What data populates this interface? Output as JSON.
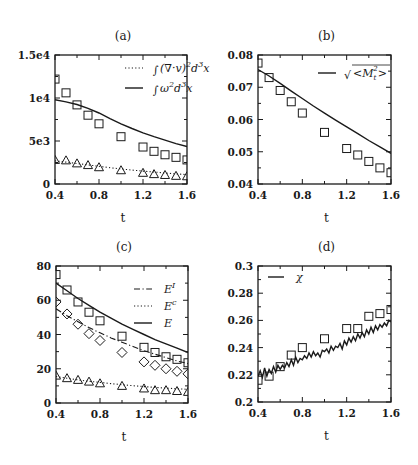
{
  "figure": {
    "width": 418,
    "height": 465,
    "background": "#ffffff",
    "ink": "#1a1a1a"
  },
  "chart_data": [
    {
      "id": "a",
      "type": "line",
      "title": "(a)",
      "xlabel": "t",
      "ylabel": "",
      "xlim": [
        0.4,
        1.6
      ],
      "ylim": [
        0,
        15000
      ],
      "xticks": [
        0.4,
        0.8,
        1.2,
        1.6
      ],
      "xtick_labels": [
        "0.4",
        "0.8",
        "1.2",
        "1.6"
      ],
      "yticks": [
        0,
        5000,
        10000,
        15000
      ],
      "ytick_labels": [
        "0",
        "5e3",
        "1e4",
        "1.5e4"
      ],
      "minor_xticks": [
        0.6,
        1.0,
        1.4
      ],
      "minor_yticks": [
        2500,
        7500,
        12500
      ],
      "frame": {
        "left": 55,
        "top": 55,
        "right": 187,
        "bottom": 184
      },
      "legend_position": "upper right",
      "grid": false,
      "series": [
        {
          "name": "∫(∇·v)² d³x",
          "style": "dotted",
          "x": [
            0.4,
            0.5,
            0.6,
            0.7,
            0.8,
            0.9,
            1.0,
            1.1,
            1.2,
            1.3,
            1.4,
            1.5,
            1.6
          ],
          "values": [
            2700,
            2550,
            2380,
            2220,
            2060,
            1900,
            1750,
            1620,
            1500,
            1390,
            1280,
            1180,
            1090
          ]
        },
        {
          "name": "∫ω² d³x",
          "style": "solid",
          "x": [
            0.4,
            0.5,
            0.6,
            0.7,
            0.8,
            0.9,
            1.0,
            1.1,
            1.2,
            1.3,
            1.4,
            1.5,
            1.6
          ],
          "values": [
            9800,
            9550,
            9250,
            8800,
            8250,
            7600,
            7000,
            6450,
            5950,
            5500,
            5100,
            4700,
            4350
          ]
        },
        {
          "name": "squares (∫ω² d³x data)",
          "style": "marker",
          "marker": "square",
          "x": [
            0.4,
            0.5,
            0.6,
            0.7,
            0.8,
            1.0,
            1.2,
            1.3,
            1.4,
            1.5,
            1.6
          ],
          "values": [
            12200,
            10600,
            9200,
            8000,
            7000,
            5500,
            4300,
            3800,
            3400,
            3100,
            2800
          ]
        },
        {
          "name": "triangles (∫(∇·v)² d³x data)",
          "style": "marker",
          "marker": "triangle",
          "x": [
            0.4,
            0.5,
            0.6,
            0.7,
            0.8,
            1.0,
            1.2,
            1.3,
            1.4,
            1.5,
            1.6
          ],
          "values": [
            2800,
            2750,
            2400,
            2200,
            1950,
            1600,
            1300,
            1150,
            1050,
            950,
            900
          ]
        }
      ],
      "legend": [
        {
          "label": "∫(∇·v)²d³x",
          "style": "dotted"
        },
        {
          "label": "∫ω²d³x",
          "style": "solid"
        }
      ]
    },
    {
      "id": "b",
      "type": "line",
      "title": "(b)",
      "xlabel": "t",
      "ylabel": "",
      "xlim": [
        0.4,
        1.6
      ],
      "ylim": [
        0.04,
        0.08
      ],
      "xticks": [
        0.4,
        0.8,
        1.2,
        1.6
      ],
      "xtick_labels": [
        "0.4",
        "0.8",
        "1.2",
        "1.6"
      ],
      "yticks": [
        0.04,
        0.05,
        0.06,
        0.07,
        0.08
      ],
      "ytick_labels": [
        "0.04",
        "0.05",
        "0.06",
        "0.07",
        "0.08"
      ],
      "minor_xticks": [
        0.6,
        1.0,
        1.4
      ],
      "minor_yticks": [
        0.045,
        0.055,
        0.065,
        0.075
      ],
      "frame": {
        "left": 258,
        "top": 55,
        "right": 391,
        "bottom": 184
      },
      "legend_position": "upper right",
      "grid": false,
      "series": [
        {
          "name": "√<M_t²>",
          "style": "solid",
          "x": [
            0.4,
            0.5,
            0.6,
            0.7,
            0.8,
            0.9,
            1.0,
            1.1,
            1.2,
            1.3,
            1.4,
            1.5,
            1.6
          ],
          "values": [
            0.0755,
            0.0735,
            0.0712,
            0.0688,
            0.0665,
            0.0642,
            0.062,
            0.0598,
            0.0577,
            0.0556,
            0.0535,
            0.0515,
            0.0495
          ]
        },
        {
          "name": "squares (data)",
          "style": "marker",
          "marker": "square",
          "x": [
            0.4,
            0.5,
            0.6,
            0.7,
            0.8,
            1.0,
            1.2,
            1.3,
            1.4,
            1.5,
            1.6
          ],
          "values": [
            0.0775,
            0.073,
            0.069,
            0.0655,
            0.062,
            0.056,
            0.051,
            0.049,
            0.047,
            0.045,
            0.0435
          ]
        }
      ],
      "legend": [
        {
          "label": "√<M_t²>",
          "style": "solid"
        }
      ]
    },
    {
      "id": "c",
      "type": "line",
      "title": "(c)",
      "xlabel": "t",
      "ylabel": "",
      "xlim": [
        0.4,
        1.6
      ],
      "ylim": [
        0,
        80
      ],
      "xticks": [
        0.4,
        0.8,
        1.2,
        1.6
      ],
      "xtick_labels": [
        "0.4",
        "0.8",
        "1.2",
        "1.6"
      ],
      "yticks": [
        0,
        20,
        40,
        60,
        80
      ],
      "ytick_labels": [
        "0",
        "20",
        "40",
        "60",
        "80"
      ],
      "minor_xticks": [
        0.6,
        1.0,
        1.4
      ],
      "minor_yticks": [
        10,
        30,
        50,
        70
      ],
      "frame": {
        "left": 56,
        "top": 266,
        "right": 188,
        "bottom": 403
      },
      "legend_position": "upper right",
      "grid": false,
      "series": [
        {
          "name": "E^I",
          "style": "dashdot",
          "x": [
            0.4,
            0.5,
            0.6,
            0.7,
            0.8,
            0.9,
            1.0,
            1.1,
            1.2,
            1.3,
            1.4,
            1.5,
            1.6
          ],
          "values": [
            55,
            51,
            47.5,
            44,
            41,
            38,
            35.5,
            33,
            30.5,
            28.5,
            26.5,
            24.5,
            23
          ]
        },
        {
          "name": "E^c",
          "style": "dotted",
          "x": [
            0.4,
            0.5,
            0.6,
            0.7,
            0.8,
            0.9,
            1.0,
            1.1,
            1.2,
            1.3,
            1.4,
            1.5,
            1.6
          ],
          "values": [
            15.5,
            14.5,
            13.5,
            12.7,
            12,
            11.3,
            10.7,
            10.1,
            9.6,
            9.1,
            8.7,
            8.3,
            8
          ]
        },
        {
          "name": "E",
          "style": "solid",
          "x": [
            0.4,
            0.5,
            0.6,
            0.7,
            0.8,
            0.9,
            1.0,
            1.1,
            1.2,
            1.3,
            1.4,
            1.5,
            1.6
          ],
          "values": [
            70,
            65.5,
            61,
            57,
            53,
            49.5,
            46,
            43,
            40,
            37,
            34.5,
            32,
            29.5
          ]
        },
        {
          "name": "squares (E data)",
          "style": "marker",
          "marker": "square",
          "x": [
            0.4,
            0.5,
            0.6,
            0.7,
            0.8,
            1.0,
            1.2,
            1.3,
            1.4,
            1.5,
            1.6
          ],
          "values": [
            75,
            66,
            59,
            53,
            48,
            39,
            32.5,
            29.5,
            27,
            25.5,
            23.5
          ]
        },
        {
          "name": "diamonds (E^I data)",
          "style": "marker",
          "marker": "diamond",
          "x": [
            0.4,
            0.5,
            0.6,
            0.7,
            0.8,
            1.0,
            1.2,
            1.3,
            1.4,
            1.5,
            1.6
          ],
          "values": [
            59,
            52,
            46,
            40.5,
            36.5,
            29.5,
            24,
            22,
            20,
            18.5,
            17
          ]
        },
        {
          "name": "triangles (E^c data)",
          "style": "marker",
          "marker": "triangle",
          "x": [
            0.4,
            0.5,
            0.6,
            0.7,
            0.8,
            1.0,
            1.2,
            1.3,
            1.4,
            1.5,
            1.6
          ],
          "values": [
            16,
            14.5,
            13.5,
            12.5,
            11.5,
            10,
            8.5,
            7.5,
            7.5,
            7,
            6.5
          ]
        }
      ],
      "legend": [
        {
          "label": "E^I",
          "style": "dashdot"
        },
        {
          "label": "E^c",
          "style": "dotted"
        },
        {
          "label": "E",
          "style": "solid"
        }
      ]
    },
    {
      "id": "d",
      "type": "line",
      "title": "(d)",
      "xlabel": "t",
      "ylabel": "",
      "xlim": [
        0.4,
        1.6
      ],
      "ylim": [
        0.2,
        0.3
      ],
      "xticks": [
        0.4,
        0.8,
        1.2,
        1.6
      ],
      "xtick_labels": [
        "0.4",
        "0.8",
        "1.2",
        "1.6"
      ],
      "yticks": [
        0.2,
        0.22,
        0.24,
        0.26,
        0.28,
        0.3
      ],
      "ytick_labels": [
        "0.2",
        "0.22",
        "0.24",
        "0.26",
        "0.28",
        "0.3"
      ],
      "minor_xticks": [
        0.6,
        1.0,
        1.4
      ],
      "minor_yticks": [
        0.21,
        0.23,
        0.25,
        0.27,
        0.29
      ],
      "frame": {
        "left": 258,
        "top": 266,
        "right": 391,
        "bottom": 402
      },
      "legend_position": "upper left",
      "grid": false,
      "series": [
        {
          "name": "χ",
          "style": "solid-jagged",
          "x": [
            0.4,
            0.42,
            0.44,
            0.46,
            0.48,
            0.5,
            0.52,
            0.54,
            0.56,
            0.58,
            0.6,
            0.62,
            0.64,
            0.66,
            0.68,
            0.7,
            0.72,
            0.74,
            0.76,
            0.78,
            0.8,
            0.82,
            0.84,
            0.86,
            0.88,
            0.9,
            0.92,
            0.94,
            0.96,
            0.98,
            1.0,
            1.02,
            1.04,
            1.06,
            1.08,
            1.1,
            1.12,
            1.14,
            1.16,
            1.18,
            1.2,
            1.22,
            1.24,
            1.26,
            1.28,
            1.3,
            1.32,
            1.34,
            1.36,
            1.38,
            1.4,
            1.42,
            1.44,
            1.46,
            1.48,
            1.5,
            1.52,
            1.54,
            1.56,
            1.58,
            1.6
          ],
          "values": [
            0.219,
            0.223,
            0.218,
            0.225,
            0.219,
            0.224,
            0.221,
            0.226,
            0.222,
            0.227,
            0.224,
            0.227,
            0.225,
            0.229,
            0.226,
            0.231,
            0.227,
            0.233,
            0.229,
            0.232,
            0.231,
            0.234,
            0.232,
            0.236,
            0.233,
            0.237,
            0.234,
            0.236,
            0.233,
            0.238,
            0.237,
            0.239,
            0.236,
            0.241,
            0.238,
            0.241,
            0.24,
            0.243,
            0.239,
            0.245,
            0.242,
            0.247,
            0.244,
            0.248,
            0.245,
            0.25,
            0.247,
            0.251,
            0.248,
            0.253,
            0.25,
            0.255,
            0.251,
            0.256,
            0.253,
            0.257,
            0.255,
            0.258,
            0.256,
            0.26,
            0.259
          ]
        },
        {
          "name": "squares (data)",
          "style": "marker",
          "marker": "square",
          "x": [
            0.4,
            0.5,
            0.6,
            0.7,
            0.8,
            1.0,
            1.2,
            1.3,
            1.4,
            1.5,
            1.6
          ],
          "values": [
            0.216,
            0.219,
            0.226,
            0.2345,
            0.24,
            0.2465,
            0.254,
            0.254,
            0.263,
            0.265,
            0.268
          ]
        }
      ],
      "legend": [
        {
          "label": "χ",
          "style": "solid"
        }
      ]
    }
  ]
}
